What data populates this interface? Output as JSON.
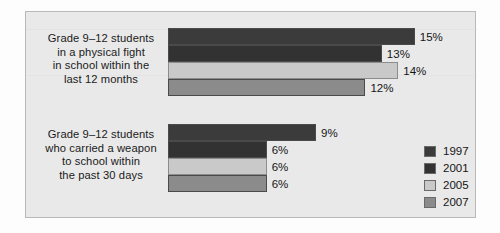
{
  "chart_data": {
    "type": "bar",
    "orientation": "horizontal",
    "title": "",
    "xlabel": "",
    "ylabel": "",
    "grid": false,
    "legend_position": "right-bottom",
    "xlim": [
      0,
      16
    ],
    "value_suffix": "%",
    "categories": [
      "Grade 9–12 students in a physical fight in school within the last 12 months",
      "Grade 9–12 students who carried a weapon to school within the past 30 days"
    ],
    "series": [
      {
        "name": "1997",
        "color": "#3b3b3b",
        "values": [
          15,
          9
        ]
      },
      {
        "name": "2001",
        "color": "#323232",
        "values": [
          13,
          6
        ]
      },
      {
        "name": "2005",
        "color": "#c9c9c9",
        "values": [
          14,
          6
        ]
      },
      {
        "name": "2007",
        "color": "#8b8b8b",
        "values": [
          12,
          6
        ]
      }
    ],
    "data_labels": [
      [
        "15%",
        "13%",
        "14%",
        "12%"
      ],
      [
        "9%",
        "6%",
        "6%",
        "6%"
      ]
    ]
  },
  "groups": [
    {
      "name": "physical-fight",
      "label_lines": [
        "Grade 9–12 students",
        "in a physical fight",
        "in school within the",
        "last 12 months"
      ],
      "bars": [
        {
          "series": "1997",
          "value": 15,
          "label": "15%"
        },
        {
          "series": "2001",
          "value": 13,
          "label": "13%"
        },
        {
          "series": "2005",
          "value": 14,
          "label": "14%"
        },
        {
          "series": "2007",
          "value": 12,
          "label": "12%"
        }
      ]
    },
    {
      "name": "carried-weapon",
      "label_lines": [
        "Grade 9–12 students",
        "who carried a weapon",
        "to school within",
        "the past 30 days"
      ],
      "bars": [
        {
          "series": "1997",
          "value": 9,
          "label": "9%"
        },
        {
          "series": "2001",
          "value": 6,
          "label": "6%"
        },
        {
          "series": "2005",
          "value": 6,
          "label": "6%"
        },
        {
          "series": "2007",
          "value": 6,
          "label": "6%"
        }
      ]
    }
  ],
  "legend": {
    "items": [
      {
        "label": "1997",
        "color": "#3b3b3b"
      },
      {
        "label": "2001",
        "color": "#323232"
      },
      {
        "label": "2005",
        "color": "#c9c9c9"
      },
      {
        "label": "2007",
        "color": "#8b8b8b"
      }
    ]
  },
  "colors": {
    "panel_background": "#e9e9e9",
    "panel_border": "#b9b9b9",
    "page_background": "#fdfdfd",
    "text": "#151515"
  }
}
